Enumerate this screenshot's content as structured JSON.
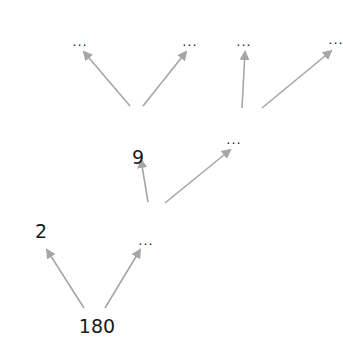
{
  "diagram": {
    "type": "factor-tree",
    "nodes": [
      {
        "id": "n180",
        "label": "180",
        "x": 97,
        "y": 326,
        "kind": "num"
      },
      {
        "id": "n2",
        "label": "2",
        "x": 41,
        "y": 231,
        "kind": "num"
      },
      {
        "id": "nA",
        "label": "...",
        "x": 146,
        "y": 240,
        "kind": "dots"
      },
      {
        "id": "n9",
        "label": "9",
        "x": 138,
        "y": 157,
        "kind": "num"
      },
      {
        "id": "nB",
        "label": "...",
        "x": 234,
        "y": 139,
        "kind": "dots"
      },
      {
        "id": "nC",
        "label": "...",
        "x": 80,
        "y": 41,
        "kind": "dots"
      },
      {
        "id": "nD",
        "label": "...",
        "x": 190,
        "y": 41,
        "kind": "dots"
      },
      {
        "id": "nE",
        "label": "...",
        "x": 244,
        "y": 41,
        "kind": "dots"
      },
      {
        "id": "nF",
        "label": "...",
        "x": 336,
        "y": 39,
        "kind": "dots"
      }
    ],
    "edges": [
      {
        "from": "n180",
        "to": "n2",
        "x1": 84,
        "y1": 308,
        "x2": 47,
        "y2": 250
      },
      {
        "from": "n180",
        "to": "nA",
        "x1": 105,
        "y1": 308,
        "x2": 140,
        "y2": 250
      },
      {
        "from": "nA",
        "to": "n9",
        "x1": 148,
        "y1": 202,
        "x2": 141,
        "y2": 160
      },
      {
        "from": "nA",
        "to": "nB",
        "x1": 165,
        "y1": 203,
        "x2": 230,
        "y2": 150
      },
      {
        "from": "n9",
        "to": "nC",
        "x1": 130,
        "y1": 106,
        "x2": 84,
        "y2": 52
      },
      {
        "from": "n9",
        "to": "nD",
        "x1": 143,
        "y1": 106,
        "x2": 186,
        "y2": 52
      },
      {
        "from": "nB",
        "to": "nE",
        "x1": 242,
        "y1": 108,
        "x2": 245,
        "y2": 52
      },
      {
        "from": "nB",
        "to": "nF",
        "x1": 262,
        "y1": 108,
        "x2": 331,
        "y2": 51
      }
    ],
    "edge_color": "#a6a6a6"
  },
  "labels": {
    "n180": "180",
    "n2": "2",
    "nA": "...",
    "n9": "9",
    "nB": "...",
    "nC": "...",
    "nD": "...",
    "nE": "...",
    "nF": "..."
  }
}
